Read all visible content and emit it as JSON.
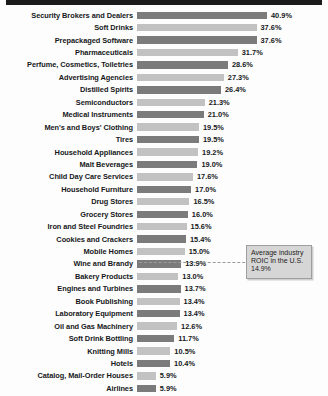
{
  "chart_data": {
    "type": "bar",
    "orientation": "horizontal",
    "title": "",
    "xlabel": "",
    "ylabel": "",
    "grid": false,
    "legend": false,
    "xlim": [
      0,
      40.9
    ],
    "value_suffix": "%",
    "categories": [
      "Security Brokers and Dealers",
      "Soft Drinks",
      "Prepackaged Software",
      "Pharmaceuticals",
      "Perfume, Cosmetics, Toiletries",
      "Advertising Agencies",
      "Distilled Spirits",
      "Semiconductors",
      "Medical Instruments",
      "Men's and Boys' Clothing",
      "Tires",
      "Household Appliances",
      "Malt Beverages",
      "Child Day Care Services",
      "Household Furniture",
      "Drug Stores",
      "Grocery Stores",
      "Iron and Steel Foundries",
      "Cookies and Crackers",
      "Mobile Homes",
      "Wine and Brandy",
      "Bakery Products",
      "Engines and Turbines",
      "Book Publishing",
      "Laboratory Equipment",
      "Oil and Gas Machinery",
      "Soft Drink Bottling",
      "Knitting Mills",
      "Hotels",
      "Catalog, Mail-Order Houses",
      "Airlines"
    ],
    "values": [
      40.9,
      37.6,
      37.6,
      31.7,
      28.6,
      27.3,
      26.4,
      21.3,
      21.0,
      19.5,
      19.5,
      19.2,
      19.0,
      17.6,
      17.0,
      16.5,
      16.0,
      15.6,
      15.4,
      15.0,
      13.9,
      13.0,
      13.7,
      13.4,
      13.4,
      12.6,
      11.7,
      10.5,
      10.4,
      5.9,
      5.9
    ],
    "value_labels": [
      "40.9%",
      "37.6%",
      "37.6%",
      "31.7%",
      "28.6%",
      "27.3%",
      "26.4%",
      "21.3%",
      "21.0%",
      "19.5%",
      "19.5%",
      "19.2%",
      "19.0%",
      "17.6%",
      "17.0%",
      "16.5%",
      "16.0%",
      "15.6%",
      "15.4%",
      "15.0%",
      "13.9%",
      "13.0%",
      "13.7%",
      "13.4%",
      "13.4%",
      "12.6%",
      "11.7%",
      "10.5%",
      "10.4%",
      "5.9%",
      "5.9%"
    ],
    "bar_colors": [
      "#7b7b7b",
      "#c2c2c2"
    ],
    "annotation": {
      "line1": "Average industry",
      "line2": "ROIC in the U.S.",
      "line3": "14.9%",
      "value": 14.9,
      "reference_line": true
    }
  }
}
